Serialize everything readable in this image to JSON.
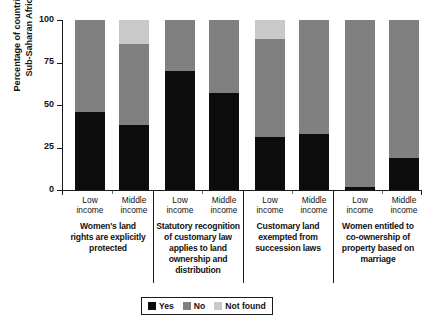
{
  "chart_data": {
    "type": "bar",
    "subtype": "stacked-bar-100-percent",
    "title": "",
    "xlabel": "",
    "ylabel": "Percentage of countries in Sub-Saharan Africa",
    "ylabel_lines": [
      "Percentage of countries in",
      "Sub-Saharan Africa"
    ],
    "ylim": [
      0,
      100
    ],
    "yticks": [
      0,
      25,
      50,
      75,
      100
    ],
    "ytick_labels": [
      "0",
      "25",
      "50",
      "75",
      "100"
    ],
    "grid": false,
    "legend_position": "bottom-center",
    "categories": [
      "Low income",
      "Middle income",
      "Low income",
      "Middle income",
      "Low income",
      "Middle income",
      "Low income",
      "Middle income"
    ],
    "groups": [
      {
        "label": "Women's land rights are explicitly protected",
        "label_lines": [
          "Women's land",
          "rights are explicitly",
          "protected"
        ],
        "categories": [
          "Low income",
          "Middle income"
        ]
      },
      {
        "label": "Statutory recognition of customary law applies to land ownership and distribution",
        "label_lines": [
          "Statutory recognition",
          "of customary law",
          "applies to land",
          "ownership and",
          "distribution"
        ],
        "categories": [
          "Low income",
          "Middle income"
        ]
      },
      {
        "label": "Customary land exempted from succession laws",
        "label_lines": [
          "Customary land",
          "exempted from",
          "succession laws"
        ],
        "categories": [
          "Low income",
          "Middle income"
        ]
      },
      {
        "label": "Women entitled to co-ownership of property based on marriage",
        "label_lines": [
          "Women entitled to",
          "co-ownership of",
          "property based on",
          "marriage"
        ],
        "categories": [
          "Low income",
          "Middle income"
        ]
      }
    ],
    "series": [
      {
        "name": "Yes",
        "color": "#0d0d0d",
        "values": [
          46,
          38,
          70,
          57,
          31,
          33,
          2,
          19
        ]
      },
      {
        "name": "No",
        "color": "#808080",
        "values": [
          54,
          48,
          30,
          43,
          58,
          67,
          98,
          81
        ]
      },
      {
        "name": "Not found",
        "color": "#c9c9c9",
        "values": [
          0,
          14,
          0,
          0,
          11,
          0,
          0,
          0
        ]
      }
    ],
    "legend": [
      {
        "label": "Yes",
        "color": "#0d0d0d"
      },
      {
        "label": "No",
        "color": "#808080"
      },
      {
        "label": "Not found",
        "color": "#c9c9c9"
      }
    ]
  },
  "sub_labels": [
    {
      "lines": [
        "Low",
        "income"
      ]
    },
    {
      "lines": [
        "Middle",
        "income"
      ]
    },
    {
      "lines": [
        "Low",
        "income"
      ]
    },
    {
      "lines": [
        "Middle",
        "income"
      ]
    },
    {
      "lines": [
        "Low",
        "income"
      ]
    },
    {
      "lines": [
        "Middle",
        "income"
      ]
    },
    {
      "lines": [
        "Low",
        "income"
      ]
    },
    {
      "lines": [
        "Middle",
        "income"
      ]
    }
  ]
}
